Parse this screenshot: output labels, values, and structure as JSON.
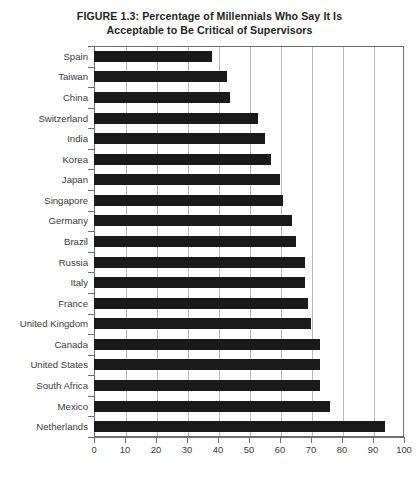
{
  "figure": {
    "title_line1": "FIGURE 1.3: Percentage of Millennials Who Say It Is",
    "title_line2": "Acceptable to Be Critical of Supervisors"
  },
  "colors": {
    "bar": "#1a1a1a",
    "gridline": "#b9babc",
    "axis": "#6d6e71",
    "text": "#231f20",
    "background": "#ffffff"
  },
  "chart_data": {
    "type": "bar",
    "orientation": "horizontal",
    "title": "FIGURE 1.3: Percentage of Millennials Who Say It Is Acceptable to Be Critical of Supervisors",
    "xlabel": "",
    "ylabel": "",
    "xlim": [
      0,
      100
    ],
    "ylim": null,
    "grid": true,
    "legend": false,
    "xticks": [
      0,
      10,
      20,
      30,
      40,
      50,
      60,
      70,
      80,
      90,
      100
    ],
    "xtick_labels": [
      "0",
      "10",
      "20",
      "30",
      "40",
      "50",
      "60",
      "70",
      "80",
      "90",
      "100"
    ],
    "categories": [
      "Spain",
      "Taiwan",
      "China",
      "Switzerland",
      "India",
      "Korea",
      "Japan",
      "Singapore",
      "Germany",
      "Brazil",
      "Russia",
      "Italy",
      "France",
      "United Kingdom",
      "Canada",
      "United States",
      "South Africa",
      "Mexico",
      "Netherlands"
    ],
    "values": [
      38,
      43,
      44,
      53,
      55,
      57,
      60,
      61,
      64,
      65,
      68,
      68,
      69,
      70,
      73,
      73,
      73,
      76,
      94
    ]
  }
}
